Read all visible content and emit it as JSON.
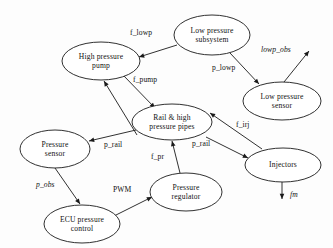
{
  "diagram": {
    "stroke_color": "#1a1a1a",
    "background_color": "#fdfdfd",
    "nodes": [
      {
        "id": "low-pressure-subsystem",
        "label_line1": "Low pressure",
        "label_line2": "subsystem",
        "cx": 212,
        "cy": 35,
        "rx": 38,
        "ry": 20
      },
      {
        "id": "high-pressure-pump",
        "label_line1": "High pressure",
        "label_line2": "pump",
        "cx": 101,
        "cy": 61,
        "rx": 39,
        "ry": 19
      },
      {
        "id": "low-pressure-sensor",
        "label_line1": "Low pressure",
        "label_line2": "sensor",
        "cx": 282,
        "cy": 101,
        "rx": 39,
        "ry": 19
      },
      {
        "id": "rail-and-high-pressure-pipes",
        "label_line1": "Rail & high",
        "label_line2": "pressure pipes",
        "cx": 172,
        "cy": 122,
        "rx": 40,
        "ry": 18
      },
      {
        "id": "pressure-sensor",
        "label_line1": "Pressure",
        "label_line2": "sensor",
        "cx": 55,
        "cy": 149,
        "rx": 35,
        "ry": 19
      },
      {
        "id": "injectors",
        "label_line1": "Injectors",
        "label_line2": "",
        "cx": 283,
        "cy": 165,
        "rx": 38,
        "ry": 17
      },
      {
        "id": "pressure-regulator",
        "label_line1": "Pressure",
        "label_line2": "regulator",
        "cx": 186,
        "cy": 192,
        "rx": 36,
        "ry": 19
      },
      {
        "id": "ecu-pressure-control",
        "label_line1": "ECU pressure",
        "label_line2": "control",
        "cx": 82,
        "cy": 224,
        "rx": 38,
        "ry": 19
      }
    ],
    "edges": [
      {
        "id": "edge-f-lowp",
        "label": "f_lowp",
        "from": "low-pressure-subsystem",
        "to": "high-pressure-pump",
        "italic": false,
        "label_x": 130,
        "label_y": 28,
        "x1": 177,
        "y1": 45,
        "x2": 139,
        "y2": 57
      },
      {
        "id": "edge-p-lowp",
        "label": "p_lowp",
        "from": "low-pressure-subsystem",
        "to": "low-pressure-sensor",
        "italic": false,
        "label_x": 212,
        "label_y": 63,
        "x1": 230,
        "y1": 53,
        "x2": 259,
        "y2": 84
      },
      {
        "id": "edge-lowp-obs",
        "label": "lowp_obs",
        "from": "low-pressure-sensor",
        "to": "observer-output",
        "italic": true,
        "label_x": 261,
        "label_y": 45,
        "x1": 284,
        "y1": 82,
        "x2": 309,
        "y2": 51
      },
      {
        "id": "edge-f-pump",
        "label": "f_pump",
        "from": "high-pressure-pump",
        "to": "rail-and-high-pressure-pipes",
        "italic": false,
        "label_x": 133,
        "label_y": 75,
        "x1": 123,
        "y1": 75,
        "x2": 155,
        "y2": 108
      },
      {
        "id": "edge-p-rail-left",
        "label": "p_rail",
        "from": "rail-and-high-pressure-pipes",
        "to": "pressure-sensor",
        "italic": false,
        "label_x": 104,
        "label_y": 140,
        "x1": 136,
        "y1": 130,
        "x2": 89,
        "y2": 141
      },
      {
        "id": "edge-p-rail-right",
        "label": "p_rail",
        "from": "rail-and-high-pressure-pipes",
        "to": "injectors",
        "italic": false,
        "label_x": 192,
        "label_y": 139,
        "x1": 206,
        "y1": 137,
        "x2": 248,
        "y2": 158
      },
      {
        "id": "edge-f-irj",
        "label": "f_irj",
        "from": "injectors",
        "to": "rail-and-high-pressure-pipes",
        "italic": false,
        "label_x": 236,
        "label_y": 120,
        "x1": 262,
        "y1": 149,
        "x2": 210,
        "y2": 113
      },
      {
        "id": "edge-f-pr",
        "label": "f_pr",
        "from": "pressure-regulator",
        "to": "rail-and-high-pressure-pipes",
        "italic": false,
        "label_x": 151,
        "label_y": 152,
        "x1": 180,
        "y1": 173,
        "x2": 172,
        "y2": 141
      },
      {
        "id": "edge-p-obs",
        "label": "p_obs",
        "from": "pressure-sensor",
        "to": "ecu-pressure-control",
        "italic": true,
        "label_x": 36,
        "label_y": 180,
        "x1": 55,
        "y1": 168,
        "x2": 80,
        "y2": 204
      },
      {
        "id": "edge-pwm",
        "label": "PWM",
        "from": "ecu-pressure-control",
        "to": "pressure-regulator",
        "italic": false,
        "label_x": 113,
        "label_y": 185,
        "x1": 114,
        "y1": 216,
        "x2": 152,
        "y2": 197
      },
      {
        "id": "edge-fm",
        "label": "fm",
        "from": "injectors",
        "to": "fuel-mass-output",
        "italic": true,
        "label_x": 290,
        "label_y": 190,
        "x1": 282,
        "y1": 182,
        "x2": 282,
        "y2": 199
      },
      {
        "id": "edge-pressure-sensor-to-pump",
        "label": "",
        "from": "pressure-sensor-region",
        "to": "high-pressure-pump",
        "italic": false,
        "label_x": 0,
        "label_y": 0,
        "x1": 137,
        "y1": 135,
        "x2": 104,
        "y2": 81
      }
    ]
  }
}
